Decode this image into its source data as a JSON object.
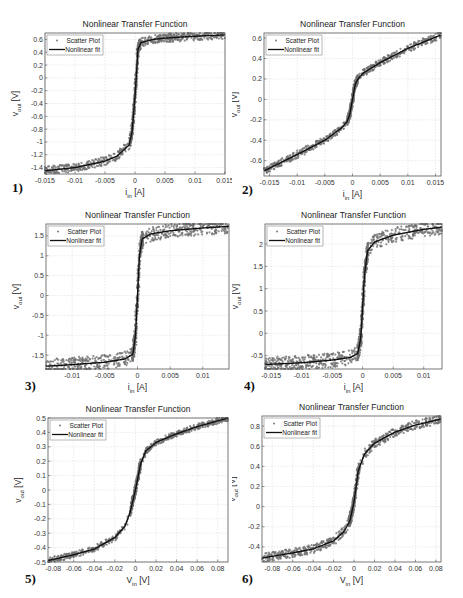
{
  "figure": {
    "panel_labels": [
      "1)",
      "2)",
      "3)",
      "4)",
      "5)",
      "6)"
    ],
    "legend": {
      "scatter": "Scatter Plot",
      "fit": "Nonlinear fit"
    },
    "colors": {
      "scatter": "#707070",
      "fit": "#111111",
      "grid": "#dcdcdc",
      "axis": "#555555"
    }
  },
  "chart_data": [
    {
      "id": 1,
      "type": "scatter",
      "title": "Nonlinear Transfer Function",
      "xlabel": "i_in [A]",
      "ylabel": "v_out [V]",
      "xlim": [
        -0.015,
        0.015
      ],
      "ylim": [
        -1.5,
        0.7
      ],
      "xticks": [
        -0.015,
        -0.01,
        -0.005,
        0,
        0.005,
        0.01,
        0.015
      ],
      "xtick_labels": [
        "-0.015",
        "-0.01",
        "-0.005",
        "0",
        "0.005",
        "0.01",
        "0.015"
      ],
      "yticks": [
        0.6,
        0.4,
        0.2,
        0,
        -0.2,
        -0.4,
        -0.6,
        -0.8,
        -1,
        -1.2,
        -1.4
      ],
      "ytick_labels": [
        "0.6",
        "0.4",
        "0.2",
        "0",
        "-0.2",
        "-0.4",
        "-0.6",
        "-0.8",
        "-1",
        "-1.2",
        "-1.4"
      ],
      "grid": true,
      "legend_position": "upper left",
      "series": [
        {
          "name": "Nonlinear fit",
          "x": [
            -0.015,
            -0.01,
            -0.005,
            -0.003,
            -0.001,
            -0.0005,
            0,
            0.0005,
            0.001,
            0.003,
            0.005,
            0.01,
            0.015
          ],
          "y": [
            -1.45,
            -1.4,
            -1.3,
            -1.22,
            -1.05,
            -0.85,
            -0.3,
            0.45,
            0.55,
            0.6,
            0.62,
            0.65,
            0.67
          ]
        }
      ],
      "noise": 0.03
    },
    {
      "id": 2,
      "type": "scatter",
      "title": "Nonlinear Transfer Function",
      "xlabel": "i_in [A]",
      "ylabel": "v_out [V]",
      "xlim": [
        -0.016,
        0.016
      ],
      "ylim": [
        -0.75,
        0.65
      ],
      "xticks": [
        -0.015,
        -0.01,
        -0.005,
        0,
        0.005,
        0.01,
        0.015
      ],
      "xtick_labels": [
        "-0.015",
        "-0.01",
        "-0.005",
        "0",
        "0.005",
        "0.01",
        "0.015"
      ],
      "yticks": [
        0.6,
        0.4,
        0.2,
        0,
        -0.2,
        -0.4,
        -0.6
      ],
      "ytick_labels": [
        "0.6",
        "0.4",
        "0.2",
        "0",
        "-0.2",
        "-0.4",
        "-0.6"
      ],
      "grid": true,
      "legend_position": "upper left",
      "series": [
        {
          "name": "Nonlinear fit",
          "x": [
            -0.016,
            -0.01,
            -0.005,
            -0.002,
            -0.001,
            -0.0005,
            0,
            0.0005,
            0.001,
            0.002,
            0.005,
            0.01,
            0.016
          ],
          "y": [
            -0.7,
            -0.54,
            -0.4,
            -0.28,
            -0.22,
            -0.15,
            0.0,
            0.15,
            0.2,
            0.26,
            0.36,
            0.5,
            0.63
          ]
        }
      ],
      "noise": 0.025
    },
    {
      "id": 3,
      "type": "scatter",
      "title": "Nonlinear Transfer Function",
      "xlabel": "i_in [A]",
      "ylabel": "v_out [V]",
      "xlim": [
        -0.014,
        0.014
      ],
      "ylim": [
        -1.85,
        1.8
      ],
      "xticks": [
        -0.01,
        -0.005,
        0,
        0.005,
        0.01
      ],
      "xtick_labels": [
        "-0.01",
        "-0.005",
        "0",
        "0.005",
        "0.01"
      ],
      "yticks": [
        1.5,
        1,
        0.5,
        0,
        -0.5,
        -1,
        -1.5
      ],
      "ytick_labels": [
        "1.5",
        "1",
        "0.5",
        "0",
        "-0.5",
        "-1",
        "-1.5"
      ],
      "grid": true,
      "legend_position": "upper left",
      "series": [
        {
          "name": "Nonlinear fit",
          "x": [
            -0.014,
            -0.01,
            -0.005,
            -0.002,
            -0.0007,
            -0.0003,
            0,
            0.0003,
            0.0007,
            0.002,
            0.005,
            0.01,
            0.014
          ],
          "y": [
            -1.78,
            -1.74,
            -1.68,
            -1.6,
            -1.48,
            -1.0,
            0.0,
            1.0,
            1.42,
            1.55,
            1.63,
            1.7,
            1.74
          ]
        }
      ],
      "noise": 0.05
    },
    {
      "id": 4,
      "type": "scatter",
      "title": "Nonlinear Transfer Function",
      "xlabel": "i_in [A]",
      "ylabel": "v_out [V]",
      "xlim": [
        -0.016,
        0.013
      ],
      "ylim": [
        -0.8,
        2.45
      ],
      "xticks": [
        -0.015,
        -0.01,
        -0.005,
        0,
        0.005,
        0.01
      ],
      "xtick_labels": [
        "-0.015",
        "-0.01",
        "-0.005",
        "0",
        "0.005",
        "0.01"
      ],
      "yticks": [
        2,
        1.5,
        1,
        0.5,
        0,
        -0.5
      ],
      "ytick_labels": [
        "2",
        "1.5",
        "1",
        "0.5",
        "0",
        "-0.5"
      ],
      "grid": true,
      "legend_position": "upper left",
      "series": [
        {
          "name": "Nonlinear fit",
          "x": [
            -0.016,
            -0.01,
            -0.005,
            -0.002,
            -0.0008,
            -0.0003,
            0,
            0.0003,
            0.0008,
            0.002,
            0.005,
            0.01,
            0.013
          ],
          "y": [
            -0.7,
            -0.66,
            -0.6,
            -0.54,
            -0.45,
            -0.1,
            0.6,
            1.3,
            1.85,
            2.05,
            2.2,
            2.33,
            2.38
          ]
        }
      ],
      "noise": 0.05
    },
    {
      "id": 5,
      "type": "scatter",
      "title": "Nonlinear Transfer Function",
      "xlabel": "V_in [V]",
      "ylabel": "v_out [V]",
      "xlim": [
        -0.085,
        0.09
      ],
      "ylim": [
        -0.5,
        0.5
      ],
      "xticks": [
        -0.08,
        -0.06,
        -0.04,
        -0.02,
        0,
        0.02,
        0.04,
        0.06,
        0.08
      ],
      "xtick_labels": [
        "-0.08",
        "-0.06",
        "-0.04",
        "-0.02",
        "0",
        "0.02",
        "0.04",
        "0.06",
        "0.08"
      ],
      "yticks": [
        0.5,
        0.4,
        0.3,
        0.2,
        0.1,
        0,
        -0.1,
        -0.2,
        -0.3,
        -0.4,
        -0.5
      ],
      "ytick_labels": [
        "0.5",
        "0.4",
        "0.3",
        "0.2",
        "0.1",
        "0",
        "-0.1",
        "-0.2",
        "-0.3",
        "-0.4",
        "-0.5"
      ],
      "grid": true,
      "legend_position": "upper left",
      "series": [
        {
          "name": "Nonlinear fit",
          "x": [
            -0.085,
            -0.06,
            -0.04,
            -0.02,
            -0.01,
            -0.005,
            0,
            0.005,
            0.01,
            0.02,
            0.04,
            0.06,
            0.09
          ],
          "y": [
            -0.49,
            -0.45,
            -0.41,
            -0.33,
            -0.25,
            -0.15,
            0.0,
            0.18,
            0.27,
            0.33,
            0.39,
            0.44,
            0.5
          ]
        }
      ],
      "noise": 0.02
    },
    {
      "id": 6,
      "type": "scatter",
      "title": "Nonlinear Transfer Function",
      "xlabel": "V_in [V]",
      "ylabel": "v_out [V]",
      "xlim": [
        -0.09,
        0.085
      ],
      "ylim": [
        -0.55,
        0.9
      ],
      "xticks": [
        -0.08,
        -0.06,
        -0.04,
        -0.02,
        0,
        0.02,
        0.04,
        0.06,
        0.08
      ],
      "xtick_labels": [
        "-0.08",
        "-0.06",
        "-0.04",
        "-0.02",
        "0",
        "0.02",
        "0.04",
        "0.06",
        "0.08"
      ],
      "yticks": [
        0.8,
        0.6,
        0.4,
        0.2,
        0,
        -0.2,
        -0.4
      ],
      "ytick_labels": [
        "0.8",
        "0.6",
        "0.4",
        "0.2",
        "0",
        "-0.2",
        "-0.4"
      ],
      "grid": true,
      "legend_position": "upper left",
      "series": [
        {
          "name": "Nonlinear fit",
          "x": [
            -0.09,
            -0.06,
            -0.04,
            -0.02,
            -0.01,
            -0.004,
            0,
            0.004,
            0.01,
            0.02,
            0.04,
            0.06,
            0.085
          ],
          "y": [
            -0.51,
            -0.46,
            -0.42,
            -0.34,
            -0.25,
            -0.14,
            0.05,
            0.35,
            0.52,
            0.63,
            0.74,
            0.81,
            0.87
          ]
        }
      ],
      "noise": 0.03
    }
  ]
}
